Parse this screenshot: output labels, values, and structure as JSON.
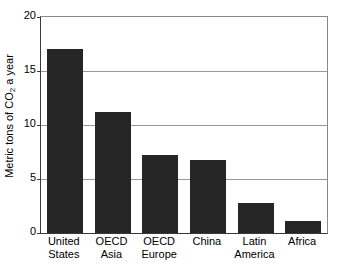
{
  "chart_data": {
    "type": "bar",
    "title": "",
    "subtitle": "",
    "xlabel": "",
    "ylabel": "Metric tons of CO2 a year",
    "ylabel_parts": {
      "pre": "Metric tons of CO",
      "sub": "2",
      "post": " a year"
    },
    "categories": [
      "United States",
      "OECD Asia",
      "OECD Europe",
      "China",
      "Latin America",
      "Africa"
    ],
    "category_lines": [
      [
        "United",
        "States"
      ],
      [
        "OECD",
        "Asia"
      ],
      [
        "OECD",
        "Europe"
      ],
      [
        "China",
        ""
      ],
      [
        "Latin",
        "America"
      ],
      [
        "Africa",
        ""
      ]
    ],
    "values": [
      17.0,
      11.2,
      7.2,
      6.8,
      2.8,
      1.1
    ],
    "ylim": [
      0,
      20
    ],
    "yticks": [
      0,
      5,
      10,
      15,
      20
    ],
    "ytick_labels": [
      "0",
      "5",
      "10",
      "15",
      "20"
    ],
    "grid": true,
    "grid_axis": "y",
    "legend": "none",
    "bar_color": "#262626",
    "axis_color": "#3a3a3a",
    "grid_color": "#9a9a9a",
    "background": "#ffffff"
  }
}
